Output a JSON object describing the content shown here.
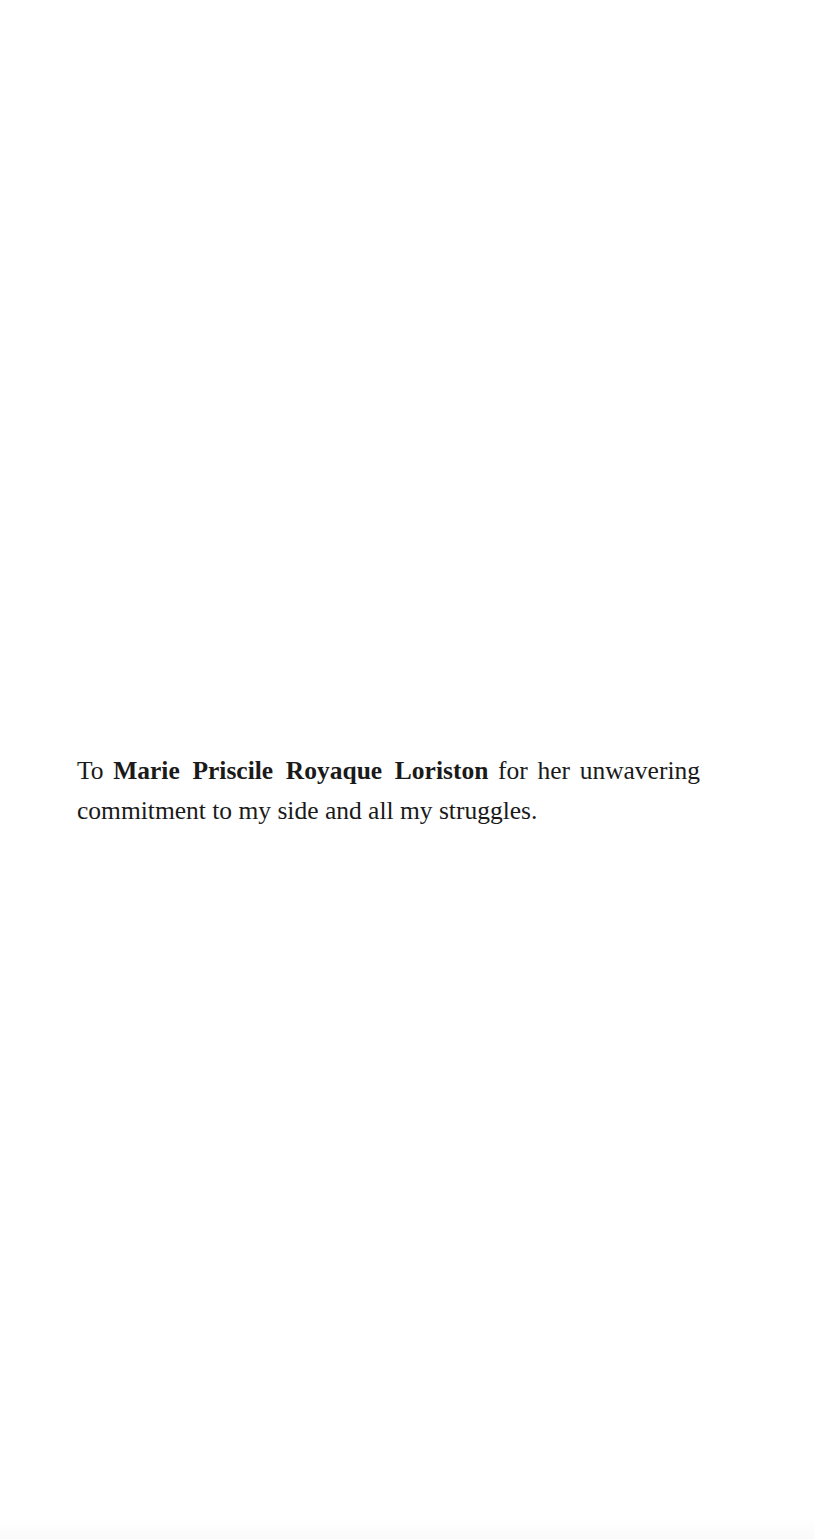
{
  "document": {
    "type": "dedication-page",
    "dedication": {
      "prefix": "To",
      "name": "Marie Priscile Royaque Loriston",
      "suffix": "for her unwavering commitment to my side and all my struggles."
    }
  },
  "colors": {
    "background": "#ffffff",
    "text": "#1a1a1a"
  }
}
